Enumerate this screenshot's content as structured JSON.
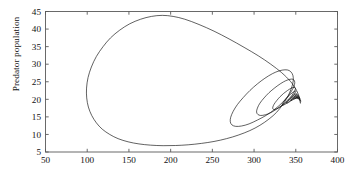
{
  "figure": {
    "kind": "phase-portrait",
    "ylabel": "Predator population",
    "caption_fragment": ""
  },
  "chart_data": {
    "type": "line",
    "title": "",
    "xlabel": "",
    "ylabel": "Predator population",
    "xlim": [
      50,
      400
    ],
    "ylim": [
      5,
      45
    ],
    "xticks": [
      50,
      100,
      150,
      200,
      250,
      300,
      350,
      400
    ],
    "yticks": [
      5,
      10,
      15,
      20,
      25,
      30,
      35,
      40,
      45
    ],
    "xtick_labels": [
      "50",
      "100",
      "150",
      "200",
      "250",
      "300",
      "350",
      "400"
    ],
    "ytick_labels": [
      "5",
      "10",
      "15",
      "20",
      "25",
      "30",
      "35",
      "40",
      "45"
    ],
    "grid": false,
    "legend": null,
    "line_color": "#000000",
    "line_width": 0.6,
    "background": "#ffffff",
    "axes_color": "#555555",
    "fixed_point": [
      355,
      19
    ],
    "series": [
      {
        "name": "trajectory",
        "points": [
          [
            356.0,
            19.5
          ],
          [
            351.0,
            22.5
          ],
          [
            344.0,
            25.0
          ],
          [
            333.0,
            27.6
          ],
          [
            320.0,
            30.0
          ],
          [
            305.0,
            32.4
          ],
          [
            288.0,
            34.8
          ],
          [
            270.0,
            37.2
          ],
          [
            252.0,
            39.4
          ],
          [
            234.0,
            41.3
          ],
          [
            217.0,
            42.8
          ],
          [
            203.0,
            43.6
          ],
          [
            190.0,
            43.9
          ],
          [
            177.0,
            43.6
          ],
          [
            164.0,
            42.8
          ],
          [
            151.0,
            41.5
          ],
          [
            139.0,
            39.7
          ],
          [
            128.0,
            37.5
          ],
          [
            119.0,
            35.0
          ],
          [
            111.0,
            32.2
          ],
          [
            105.0,
            29.2
          ],
          [
            101.0,
            26.2
          ],
          [
            99.2,
            23.2
          ],
          [
            99.4,
            20.4
          ],
          [
            101.4,
            17.8
          ],
          [
            105.4,
            15.4
          ],
          [
            111.0,
            13.3
          ],
          [
            118.0,
            11.5
          ],
          [
            127.0,
            10.0
          ],
          [
            137.0,
            8.8
          ],
          [
            149.0,
            7.9
          ],
          [
            162.0,
            7.3
          ],
          [
            176.0,
            6.95
          ],
          [
            191.0,
            6.8
          ],
          [
            206.0,
            6.85
          ],
          [
            221.0,
            7.05
          ],
          [
            237.0,
            7.45
          ],
          [
            252.0,
            8.0
          ],
          [
            267.0,
            8.8
          ],
          [
            281.0,
            9.8
          ],
          [
            295.0,
            11.1
          ],
          [
            307.0,
            12.6
          ],
          [
            318.0,
            14.4
          ],
          [
            327.0,
            16.3
          ],
          [
            334.0,
            18.4
          ],
          [
            340.0,
            20.6
          ],
          [
            344.0,
            22.7
          ],
          [
            346.5,
            24.6
          ],
          [
            347.0,
            26.2
          ],
          [
            345.5,
            27.4
          ],
          [
            342.0,
            28.2
          ],
          [
            337.0,
            28.4
          ],
          [
            330.0,
            28.1
          ],
          [
            322.0,
            27.3
          ],
          [
            313.0,
            26.0
          ],
          [
            304.0,
            24.4
          ],
          [
            295.0,
            22.5
          ],
          [
            287.0,
            20.5
          ],
          [
            280.0,
            18.5
          ],
          [
            275.0,
            16.6
          ],
          [
            272.0,
            14.9
          ],
          [
            271.5,
            13.6
          ],
          [
            273.5,
            12.7
          ],
          [
            278.0,
            12.3
          ],
          [
            285.0,
            12.4
          ],
          [
            294.0,
            13.0
          ],
          [
            304.0,
            14.1
          ],
          [
            315.0,
            15.5
          ],
          [
            325.0,
            17.2
          ],
          [
            334.0,
            19.1
          ],
          [
            341.0,
            21.0
          ],
          [
            346.0,
            22.8
          ],
          [
            348.5,
            24.2
          ],
          [
            348.5,
            25.2
          ],
          [
            346.5,
            25.7
          ],
          [
            343.0,
            25.7
          ],
          [
            338.0,
            25.3
          ],
          [
            332.0,
            24.5
          ],
          [
            325.0,
            23.3
          ],
          [
            318.0,
            21.9
          ],
          [
            312.0,
            20.4
          ],
          [
            307.0,
            18.9
          ],
          [
            304.0,
            17.5
          ],
          [
            303.0,
            16.4
          ],
          [
            304.5,
            15.7
          ],
          [
            308.0,
            15.4
          ],
          [
            313.5,
            15.6
          ],
          [
            320.0,
            16.2
          ],
          [
            327.0,
            17.2
          ],
          [
            334.0,
            18.4
          ],
          [
            340.0,
            19.7
          ],
          [
            345.0,
            21.0
          ],
          [
            348.0,
            22.1
          ],
          [
            349.5,
            22.9
          ],
          [
            349.0,
            23.3
          ],
          [
            347.0,
            23.4
          ],
          [
            344.0,
            23.1
          ],
          [
            340.0,
            22.5
          ],
          [
            335.5,
            21.7
          ],
          [
            331.0,
            20.7
          ],
          [
            327.0,
            19.6
          ],
          [
            324.0,
            18.6
          ],
          [
            322.5,
            17.8
          ],
          [
            322.5,
            17.3
          ],
          [
            324.0,
            17.1
          ],
          [
            327.0,
            17.3
          ],
          [
            331.0,
            17.8
          ],
          [
            335.5,
            18.5
          ],
          [
            340.0,
            19.4
          ],
          [
            344.0,
            20.3
          ],
          [
            347.0,
            21.1
          ],
          [
            349.0,
            21.8
          ],
          [
            350.0,
            22.2
          ],
          [
            349.8,
            22.4
          ],
          [
            348.6,
            22.3
          ],
          [
            346.6,
            22.0
          ],
          [
            344.0,
            21.5
          ],
          [
            341.2,
            20.9
          ],
          [
            338.4,
            20.2
          ],
          [
            336.0,
            19.5
          ],
          [
            334.4,
            18.9
          ],
          [
            333.8,
            18.5
          ],
          [
            334.2,
            18.3
          ],
          [
            335.6,
            18.4
          ],
          [
            338.0,
            18.7
          ],
          [
            341.0,
            19.2
          ],
          [
            344.2,
            19.8
          ],
          [
            347.0,
            20.4
          ],
          [
            349.2,
            21.0
          ],
          [
            350.6,
            21.4
          ],
          [
            351.0,
            21.6
          ],
          [
            350.6,
            21.6
          ],
          [
            349.4,
            21.5
          ],
          [
            347.6,
            21.2
          ],
          [
            345.4,
            20.8
          ],
          [
            343.2,
            20.3
          ],
          [
            341.2,
            19.8
          ],
          [
            339.8,
            19.4
          ],
          [
            339.0,
            19.1
          ],
          [
            339.0,
            18.9
          ],
          [
            339.8,
            18.9
          ],
          [
            341.2,
            19.1
          ],
          [
            343.2,
            19.4
          ],
          [
            345.6,
            19.8
          ],
          [
            348.0,
            20.3
          ],
          [
            350.0,
            20.7
          ],
          [
            351.4,
            21.1
          ],
          [
            352.0,
            21.3
          ],
          [
            351.9,
            21.4
          ],
          [
            351.2,
            21.3
          ],
          [
            350.0,
            21.2
          ],
          [
            348.4,
            20.9
          ],
          [
            346.8,
            20.6
          ],
          [
            345.4,
            20.3
          ],
          [
            344.4,
            20.0
          ],
          [
            344.0,
            19.8
          ],
          [
            344.2,
            19.7
          ],
          [
            345.0,
            19.7
          ],
          [
            346.4,
            19.9
          ],
          [
            348.2,
            20.1
          ],
          [
            350.0,
            20.4
          ],
          [
            351.6,
            20.7
          ],
          [
            352.6,
            21.0
          ],
          [
            353.0,
            21.1
          ],
          [
            352.8,
            21.1
          ],
          [
            352.2,
            21.1
          ],
          [
            351.2,
            20.9
          ],
          [
            350.0,
            20.8
          ],
          [
            348.8,
            20.6
          ],
          [
            347.9,
            20.4
          ],
          [
            347.4,
            20.2
          ],
          [
            347.4,
            20.1
          ],
          [
            347.9,
            20.1
          ],
          [
            348.9,
            20.2
          ],
          [
            350.2,
            20.3
          ],
          [
            351.6,
            20.5
          ],
          [
            352.8,
            20.7
          ],
          [
            353.5,
            20.8
          ],
          [
            353.7,
            20.9
          ],
          [
            353.4,
            20.9
          ],
          [
            352.8,
            20.8
          ],
          [
            351.9,
            20.7
          ],
          [
            351.0,
            20.6
          ],
          [
            350.2,
            20.5
          ],
          [
            349.7,
            20.4
          ],
          [
            349.6,
            20.3
          ],
          [
            349.9,
            20.3
          ],
          [
            350.6,
            20.3
          ],
          [
            351.6,
            20.4
          ],
          [
            352.6,
            20.5
          ],
          [
            353.5,
            20.6
          ],
          [
            354.0,
            20.6
          ],
          [
            354.2,
            20.6
          ],
          [
            354.0,
            20.6
          ],
          [
            353.5,
            20.6
          ],
          [
            352.9,
            20.5
          ],
          [
            352.2,
            20.4
          ],
          [
            351.7,
            20.4
          ],
          [
            351.5,
            20.3
          ],
          [
            351.6,
            20.3
          ],
          [
            352.0,
            20.3
          ],
          [
            352.7,
            20.3
          ],
          [
            353.4,
            20.4
          ],
          [
            354.1,
            20.4
          ],
          [
            354.5,
            20.4
          ],
          [
            354.6,
            20.4
          ],
          [
            354.5,
            20.4
          ],
          [
            354.1,
            20.4
          ],
          [
            353.6,
            20.3
          ],
          [
            353.1,
            20.3
          ],
          [
            352.7,
            20.2
          ],
          [
            352.6,
            20.2
          ],
          [
            352.8,
            20.2
          ],
          [
            353.2,
            20.2
          ],
          [
            353.7,
            20.2
          ],
          [
            354.2,
            20.2
          ],
          [
            354.7,
            20.2
          ],
          [
            354.9,
            20.2
          ],
          [
            354.9,
            20.2
          ],
          [
            354.7,
            20.2
          ],
          [
            354.4,
            20.1
          ],
          [
            354.0,
            20.1
          ],
          [
            353.7,
            20.1
          ],
          [
            353.5,
            20.1
          ],
          [
            353.6,
            20.1
          ],
          [
            353.9,
            20.0
          ],
          [
            354.3,
            20.0
          ],
          [
            354.7,
            20.0
          ],
          [
            355.0,
            20.0
          ],
          [
            355.1,
            20.0
          ],
          [
            355.0,
            20.0
          ],
          [
            354.8,
            20.0
          ],
          [
            354.5,
            19.9
          ],
          [
            354.2,
            19.9
          ],
          [
            354.1,
            19.9
          ],
          [
            354.2,
            19.9
          ],
          [
            354.4,
            19.9
          ],
          [
            354.7,
            19.8
          ],
          [
            355.0,
            19.8
          ],
          [
            355.2,
            19.8
          ],
          [
            355.2,
            19.8
          ],
          [
            355.1,
            19.8
          ],
          [
            354.9,
            19.7
          ],
          [
            354.7,
            19.7
          ],
          [
            354.6,
            19.7
          ],
          [
            354.7,
            19.7
          ],
          [
            354.9,
            19.6
          ],
          [
            355.1,
            19.6
          ],
          [
            355.3,
            19.6
          ],
          [
            355.3,
            19.6
          ],
          [
            355.2,
            19.5
          ],
          [
            355.0,
            19.5
          ],
          [
            354.9,
            19.5
          ],
          [
            354.9,
            19.5
          ],
          [
            355.1,
            19.4
          ],
          [
            355.3,
            19.4
          ],
          [
            355.4,
            19.4
          ],
          [
            355.3,
            19.4
          ],
          [
            355.2,
            19.3
          ],
          [
            355.1,
            19.3
          ],
          [
            355.1,
            19.3
          ],
          [
            355.2,
            19.3
          ],
          [
            355.4,
            19.2
          ],
          [
            355.4,
            19.2
          ],
          [
            355.3,
            19.2
          ],
          [
            355.2,
            19.2
          ],
          [
            355.2,
            19.1
          ],
          [
            355.3,
            19.1
          ],
          [
            355.4,
            19.1
          ],
          [
            355.4,
            19.1
          ],
          [
            355.3,
            19.0
          ],
          [
            355.2,
            19.0
          ],
          [
            355.3,
            19.0
          ],
          [
            355.4,
            19.0
          ],
          [
            355.3,
            19.0
          ],
          [
            355.3,
            18.95
          ],
          [
            355.3,
            18.95
          ],
          [
            355.35,
            18.9
          ],
          [
            355.3,
            18.9
          ],
          [
            355.3,
            18.9
          ]
        ]
      }
    ]
  }
}
